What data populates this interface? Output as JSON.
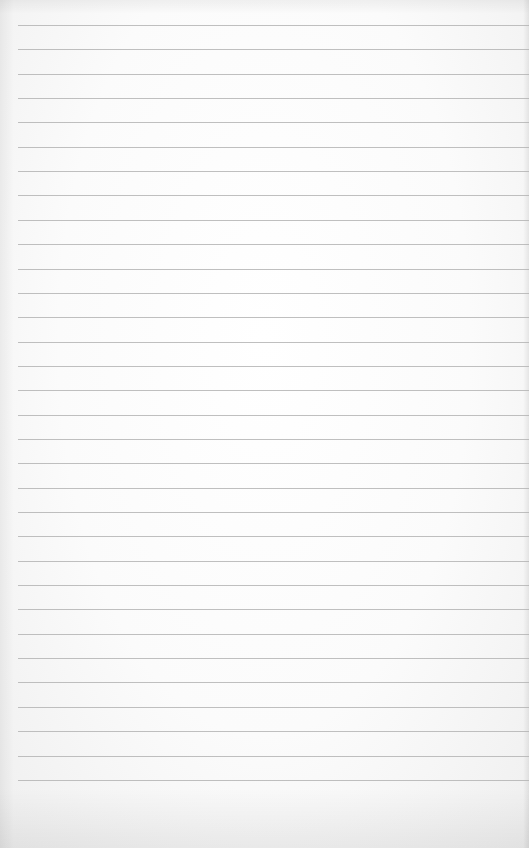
{
  "page": {
    "rule_count": 32,
    "first_rule_y": 25,
    "rule_spacing": 24.35,
    "rule_left": 18,
    "rule_color": "#b4b4b4",
    "paper_color": "#fbfbfb"
  }
}
